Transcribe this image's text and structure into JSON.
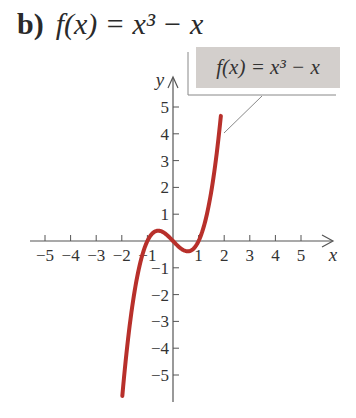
{
  "title": {
    "part_label": "b)",
    "expression": "f(x) = x³ − x"
  },
  "chart_data": {
    "type": "line",
    "function": "x^3 - x",
    "xlabel": "x",
    "ylabel": "y",
    "xlim": [
      -5.5,
      6
    ],
    "ylim": [
      -6,
      6
    ],
    "x_ticks": [
      -5,
      -4,
      -3,
      -2,
      -1,
      1,
      2,
      3,
      4,
      5
    ],
    "y_ticks": [
      -5,
      -4,
      -3,
      -2,
      -1,
      1,
      2,
      3,
      4,
      5
    ],
    "x_tick_labels": [
      "−5",
      "−4",
      "−3",
      "−2",
      "−1",
      "1",
      "2",
      "3",
      "4",
      "5"
    ],
    "y_tick_labels": [
      "−5",
      "−4",
      "−3",
      "−2",
      "−1",
      "1",
      "2",
      "3",
      "4",
      "5"
    ],
    "grid": false,
    "legend": {
      "text": "f(x) = x³ − x",
      "position": "top-right"
    },
    "series": [
      {
        "name": "f(x) = x³ − x",
        "color": "#b8302b",
        "x": [
          -1.98,
          -1.75,
          -1.5,
          -1.25,
          -1.0,
          -0.75,
          -0.577,
          -0.25,
          0.0,
          0.25,
          0.577,
          0.75,
          1.0,
          1.25,
          1.5,
          1.75,
          1.87
        ],
        "y": [
          -5.78,
          -3.61,
          -1.88,
          -0.7,
          0.0,
          0.33,
          0.385,
          0.23,
          0.0,
          -0.23,
          -0.385,
          -0.33,
          0.0,
          0.7,
          1.88,
          3.61,
          4.67
        ]
      }
    ],
    "key_points": {
      "zeros": [
        -1,
        0,
        1
      ],
      "local_max": [
        -0.577,
        0.385
      ],
      "local_min": [
        0.577,
        -0.385
      ]
    }
  },
  "colors": {
    "curve": "#b8302b",
    "axis": "#555555",
    "legend_fill": "#d3cfcc"
  }
}
